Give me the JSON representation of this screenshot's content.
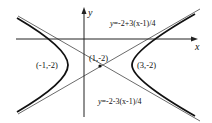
{
  "diagram": {
    "type": "hyperbola",
    "colors": {
      "curve": "#111111",
      "asymptote": "#444444",
      "axis": "#222222",
      "background": "#ffffff"
    },
    "axes": {
      "x_label": "x",
      "y_label": "y"
    },
    "center": {
      "label": "(1,-2)",
      "x": 1,
      "y": -2
    },
    "vertices": [
      {
        "label": "(-1,-2)",
        "x": -1,
        "y": -2
      },
      {
        "label": "(3,-2)",
        "x": 3,
        "y": -2
      }
    ],
    "asymptotes": [
      {
        "label_prefix": "y",
        "label": "=-2+3(x-1)/4",
        "equation": "y=-2+3(x-1)/4"
      },
      {
        "label_prefix": "y",
        "label": "=-2-3(x-1)/4",
        "equation": "y=-2-3(x-1)/4"
      }
    ]
  }
}
